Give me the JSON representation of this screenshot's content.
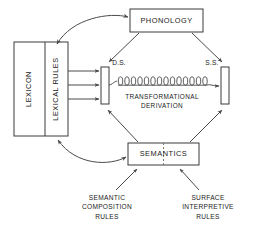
{
  "diagram": {
    "background_color": "#ffffff",
    "line_color": "#4a4a4a",
    "text_color": "#1a1a1a",
    "boxes": {
      "lexicon": {
        "label": "LEXICON",
        "orientation": "vertical"
      },
      "lexical_rules": {
        "label": "LEXICAL RULES",
        "orientation": "vertical"
      },
      "phonology": {
        "label": "PHONOLOGY",
        "orientation": "horizontal"
      },
      "semantics": {
        "label": "SEMANTICS",
        "orientation": "horizontal",
        "divider": "dashed"
      }
    },
    "nodes": {
      "deep_structure": {
        "label": "D.S."
      },
      "surface_structure": {
        "label": "S.S."
      }
    },
    "center_label": {
      "line1": "TRANSFORMATIONAL",
      "line2": "DERIVATION"
    },
    "footnotes": {
      "left": {
        "line1": "SEMANTIC",
        "line2": "COMPOSITION",
        "line3": "RULES"
      },
      "right": {
        "line1": "SURFACE",
        "line2": "INTERPRETIVE",
        "line3": "RULES"
      }
    }
  }
}
